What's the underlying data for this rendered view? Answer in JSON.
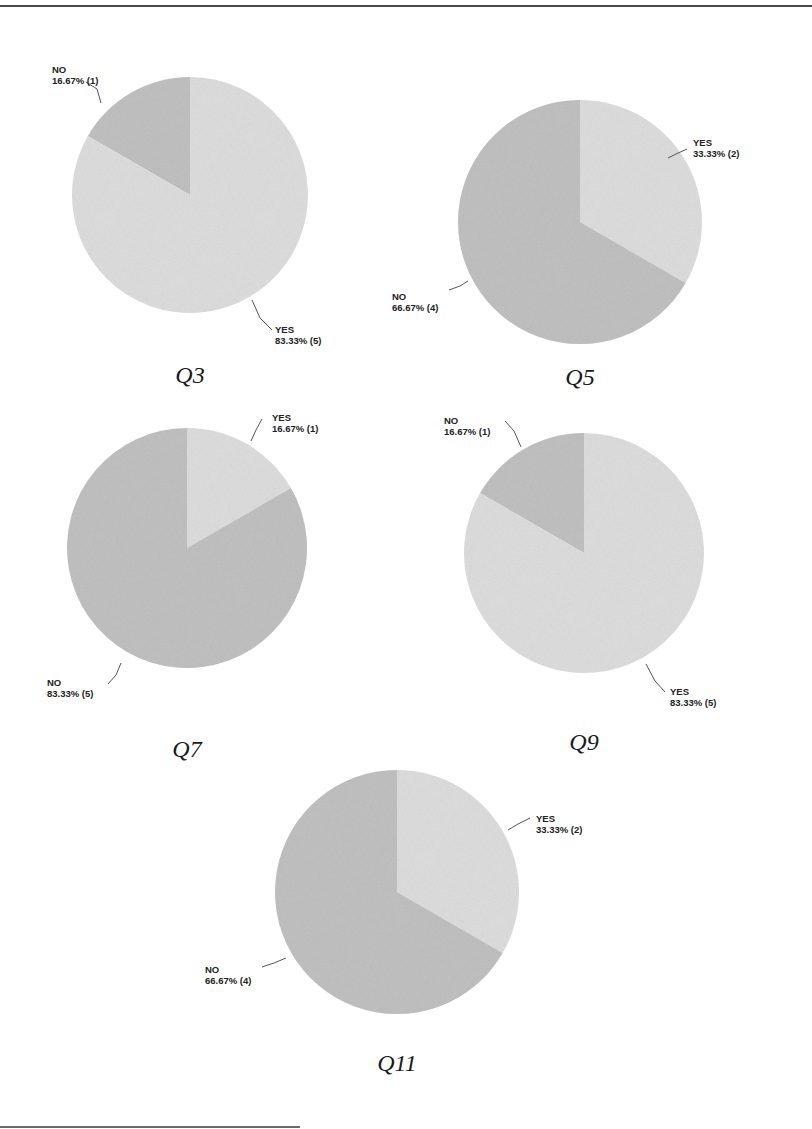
{
  "colors": {
    "yes": "#dcdcdc",
    "no": "#bdbdbd",
    "text": "#222222"
  },
  "chart_data": [
    {
      "type": "pie",
      "title": "Q3",
      "slices": [
        {
          "label": "NO",
          "percent": 16.67,
          "count": 1,
          "text": "16.67% (1)"
        },
        {
          "label": "YES",
          "percent": 83.33,
          "count": 5,
          "text": "83.33% (5)"
        }
      ]
    },
    {
      "type": "pie",
      "title": "Q5",
      "slices": [
        {
          "label": "YES",
          "percent": 33.33,
          "count": 2,
          "text": "33.33% (2)"
        },
        {
          "label": "NO",
          "percent": 66.67,
          "count": 4,
          "text": "66.67% (4)"
        }
      ]
    },
    {
      "type": "pie",
      "title": "Q7",
      "slices": [
        {
          "label": "YES",
          "percent": 16.67,
          "count": 1,
          "text": "16.67% (1)"
        },
        {
          "label": "NO",
          "percent": 83.33,
          "count": 5,
          "text": "83.33% (5)"
        }
      ]
    },
    {
      "type": "pie",
      "title": "Q9",
      "slices": [
        {
          "label": "NO",
          "percent": 16.67,
          "count": 1,
          "text": "16.67% (1)"
        },
        {
          "label": "YES",
          "percent": 83.33,
          "count": 5,
          "text": "83.33% (5)"
        }
      ]
    },
    {
      "type": "pie",
      "title": "Q11",
      "slices": [
        {
          "label": "YES",
          "percent": 33.33,
          "count": 2,
          "text": "33.33% (2)"
        },
        {
          "label": "NO",
          "percent": 66.67,
          "count": 4,
          "text": "66.67% (4)"
        }
      ]
    }
  ],
  "layout": [
    {
      "cx": 190,
      "cy": 195,
      "r": 118,
      "startSide": "ccw",
      "capX": 190,
      "capY": 383,
      "labels": [
        {
          "x": 52,
          "y": 73,
          "lx1": 86,
          "ly1": 82,
          "lx2": 97,
          "ly2": 89,
          "lx3": 101,
          "ly3": 103
        },
        {
          "x": 275,
          "y": 333,
          "lx1": 252,
          "ly1": 300,
          "lx2": 260,
          "ly2": 318,
          "lx3": 272,
          "ly3": 330
        }
      ]
    },
    {
      "cx": 580,
      "cy": 222,
      "r": 122,
      "startSide": "cw",
      "capX": 580,
      "capY": 385,
      "labels": [
        {
          "x": 693,
          "y": 146,
          "lx1": 687,
          "ly1": 149,
          "lx2": 676,
          "ly2": 154,
          "lx3": 668,
          "ly3": 158
        },
        {
          "x": 392,
          "y": 300,
          "lx1": 449,
          "ly1": 290,
          "lx2": 460,
          "ly2": 286,
          "lx3": 468,
          "ly3": 281
        }
      ]
    },
    {
      "cx": 187,
      "cy": 548,
      "r": 120,
      "startSide": "cw",
      "capX": 187,
      "capY": 757,
      "labels": [
        {
          "x": 272,
          "y": 421,
          "lx1": 262,
          "ly1": 419,
          "lx2": 256,
          "ly2": 430,
          "lx3": 251,
          "ly3": 441
        },
        {
          "x": 47,
          "y": 686,
          "lx1": 108,
          "ly1": 684,
          "lx2": 116,
          "ly2": 675,
          "lx3": 121,
          "ly3": 663
        }
      ]
    },
    {
      "cx": 584,
      "cy": 553,
      "r": 120,
      "startSide": "ccw",
      "capX": 584,
      "capY": 750,
      "labels": [
        {
          "x": 444,
          "y": 424,
          "lx1": 505,
          "ly1": 421,
          "lx2": 514,
          "ly2": 431,
          "lx3": 521,
          "ly3": 447
        },
        {
          "x": 670,
          "y": 695,
          "lx1": 646,
          "ly1": 664,
          "lx2": 655,
          "ly2": 681,
          "lx3": 665,
          "ly3": 692
        }
      ]
    },
    {
      "cx": 397,
      "cy": 892,
      "r": 122,
      "startSide": "cw",
      "capX": 397,
      "capY": 1071,
      "labels": [
        {
          "x": 536,
          "y": 822,
          "lx1": 530,
          "ly1": 818,
          "lx2": 518,
          "ly2": 824,
          "lx3": 508,
          "ly3": 830
        },
        {
          "x": 205,
          "y": 973,
          "lx1": 262,
          "ly1": 967,
          "lx2": 274,
          "ly2": 963,
          "lx3": 286,
          "ly3": 958
        }
      ]
    }
  ]
}
